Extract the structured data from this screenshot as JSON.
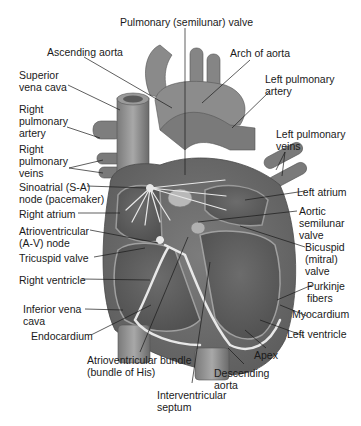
{
  "figure": {
    "colors": {
      "background": "#ffffff",
      "tissue_dark": "#6e6e6e",
      "tissue_mid": "#8c8c8c",
      "tissue_light": "#b4b4b4",
      "chamber": "#5a5a5a",
      "conduction": "#e6e6e6",
      "leader_line": "#1a1a1a"
    }
  },
  "labels": {
    "pulmonary_valve": "Pulmonary (semilunar) valve",
    "ascending_aorta": "Ascending aorta",
    "arch_of_aorta": "Arch of aorta",
    "superior_vena_cava": "Superior\nvena cava",
    "left_pulmonary_artery": "Left pulmonary\nartery",
    "right_pulmonary_artery": "Right\npulmonary\nartery",
    "left_pulmonary_veins": "Left pulmonary\nveins",
    "right_pulmonary_veins": "Right\npulmonary\nveins",
    "sa_node": "Sinoatrial (S-A)\nnode (pacemaker)",
    "left_atrium": "Left atrium",
    "right_atrium": "Right atrium",
    "aortic_valve": "Aortic\nsemilunar\nvalve",
    "av_node": "Atrioventricular\n(A-V) node",
    "bicuspid_valve": "Bicuspid\n(mitral)\nvalve",
    "tricuspid_valve": "Tricuspid valve",
    "right_ventricle": "Right ventricle",
    "purkinje_fibers": "Purkinje\nfibers",
    "inferior_vena_cava": "Inferior vena\ncava",
    "myocardium": "Myocardium",
    "endocardium": "Endocardium",
    "left_ventricle": "Left ventricle",
    "apex": "Apex",
    "av_bundle": "Atrioventricular bundle\n(bundle of His)",
    "descending_aorta": "Descending\naorta",
    "interventricular_septum": "Interventricular\nseptum"
  }
}
